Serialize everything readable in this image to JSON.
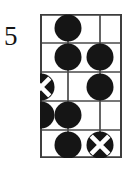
{
  "diagram": {
    "type": "chord-diagram",
    "instrument": "guitar",
    "position_label": "5",
    "strings": 4,
    "frets": 5,
    "colors": {
      "ink": "#151515",
      "grid": "#4a4a4a",
      "paper": "#ffffff",
      "marker_fill": "#151515",
      "marker_cross": "#ffffff"
    },
    "geometry": {
      "grid_left": 40,
      "grid_top": 14,
      "grid_right": 122,
      "grid_bottom": 158,
      "string_x": [
        40,
        68,
        100,
        122
      ],
      "fret_y": [
        14,
        43,
        72,
        101,
        130,
        158
      ]
    },
    "markers": [
      {
        "name": "marker-f1-s2",
        "fret": 1,
        "string": 2,
        "style": "filled-dot",
        "cx": 68,
        "cy": 28
      },
      {
        "name": "marker-f2-s2",
        "fret": 2,
        "string": 2,
        "style": "filled-dot",
        "cx": 68,
        "cy": 57
      },
      {
        "name": "marker-f2-s3",
        "fret": 2,
        "string": 3,
        "style": "filled-dot",
        "cx": 100,
        "cy": 57
      },
      {
        "name": "marker-f3-s1",
        "fret": 3,
        "string": 1,
        "style": "cross-dot",
        "cx": 41,
        "cy": 87
      },
      {
        "name": "marker-f3-s3",
        "fret": 3,
        "string": 3,
        "style": "filled-dot",
        "cx": 100,
        "cy": 87
      },
      {
        "name": "marker-f4-s1",
        "fret": 4,
        "string": 1,
        "style": "filled-dot",
        "cx": 41,
        "cy": 115
      },
      {
        "name": "marker-f4-s2",
        "fret": 4,
        "string": 2,
        "style": "filled-dot",
        "cx": 68,
        "cy": 115
      },
      {
        "name": "marker-f5-s2",
        "fret": 5,
        "string": 2,
        "style": "filled-dot",
        "cx": 68,
        "cy": 145
      },
      {
        "name": "marker-f5-s3",
        "fret": 5,
        "string": 3,
        "style": "cross-dot",
        "cx": 100,
        "cy": 145
      }
    ],
    "marker_radius": 13,
    "legend": {
      "filled_dot_meaning": "fretted note",
      "cross_dot_meaning": "root note"
    }
  }
}
